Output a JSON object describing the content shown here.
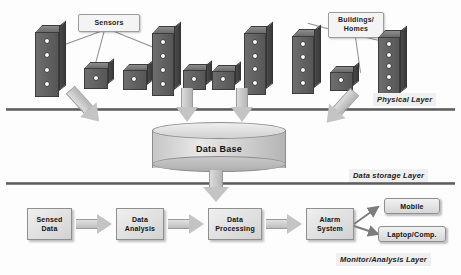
{
  "diagram": {
    "type": "layered-architecture-diagram"
  },
  "physical_layer": {
    "tag": "Physical Layer",
    "callouts": [
      {
        "id": "sensors",
        "label": "Sensors"
      },
      {
        "id": "buildings",
        "label": "Buildings/\nHomes",
        "line1": "Buildings/",
        "line2": "Homes"
      }
    ],
    "nodes": [
      {
        "id": "bldg-1",
        "kind": "tall-building",
        "dots": 4
      },
      {
        "id": "box-1",
        "kind": "small-box",
        "dots": 1
      },
      {
        "id": "box-2",
        "kind": "small-box",
        "dots": 1
      },
      {
        "id": "bldg-2",
        "kind": "tall-building",
        "dots": 4
      },
      {
        "id": "box-3",
        "kind": "small-box",
        "dots": 1
      },
      {
        "id": "box-4",
        "kind": "small-box",
        "dots": 1
      },
      {
        "id": "bldg-3",
        "kind": "tall-building",
        "dots": 4
      },
      {
        "id": "bldg-4",
        "kind": "tall-building",
        "dots": 4
      },
      {
        "id": "box-5",
        "kind": "small-box",
        "dots": 1
      },
      {
        "id": "bldg-5",
        "kind": "tall-building",
        "dots": 5
      }
    ]
  },
  "storage_layer": {
    "tag": "Data storage Layer",
    "database_label": "Data Base"
  },
  "monitor_layer": {
    "tag": "Monitor/Analysis Layer",
    "process_boxes": [
      {
        "id": "sensed-data",
        "line1": "Sensed",
        "line2": "Data"
      },
      {
        "id": "data-analysis",
        "line1": "Data",
        "line2": "Analysis"
      },
      {
        "id": "data-processing",
        "line1": "Data",
        "line2": "Processing"
      },
      {
        "id": "alarm-system",
        "line1": "Alarm",
        "line2": "System"
      }
    ],
    "outputs": [
      {
        "id": "mobile",
        "label": "Mobile"
      },
      {
        "id": "laptop",
        "label": "Laptop/Comp."
      }
    ]
  },
  "colors": {
    "background": "#fdfdfd",
    "building_fill": "#5a5a5a",
    "box_fill": "#e0e0e0",
    "arrow_fill": "#c8c8c8",
    "line": "#6a6a6a",
    "text": "#121212"
  }
}
